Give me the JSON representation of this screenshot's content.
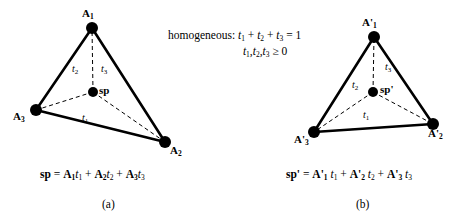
{
  "figure": {
    "type": "geometric-diagram",
    "constraint": {
      "prefix_label": "homogeneous:",
      "line1": "t1 + t2 + t3 = 1",
      "line2": "t1, t2, t3 >= 0",
      "sum_terms": [
        "t",
        "t",
        "t"
      ],
      "sum_subscripts": [
        "1",
        "2",
        "3"
      ],
      "sum_equals": "=",
      "sum_value": "1",
      "inequality_symbol": "≥",
      "inequality_value": "0"
    },
    "panels": [
      {
        "id": "a",
        "caption": "(a)",
        "prime": false,
        "point_label": "sp",
        "equation": {
          "lhs": "sp",
          "eq": "=",
          "terms": [
            {
              "vector": "A",
              "vsub": "1",
              "scalar": "t",
              "ssub": "1"
            },
            {
              "vector": "A",
              "vsub": "2",
              "scalar": "t",
              "ssub": "2"
            },
            {
              "vector": "A",
              "vsub": "3",
              "scalar": "t",
              "ssub": "3"
            }
          ],
          "plus": "+"
        },
        "vertices": [
          {
            "name": "A",
            "sub": "1",
            "x": 92,
            "y": 28,
            "label_x": 82,
            "label_y": 8
          },
          {
            "name": "A",
            "sub": "2",
            "x": 165,
            "y": 142,
            "label_x": 170,
            "label_y": 145
          },
          {
            "name": "A",
            "sub": "3",
            "x": 36,
            "y": 110,
            "label_x": 13,
            "label_y": 111
          }
        ],
        "point": {
          "x": 93,
          "y": 92,
          "label_x": 99,
          "label_y": 85
        },
        "parameters": [
          {
            "name": "t",
            "sub": "1",
            "x": 82,
            "y": 113
          },
          {
            "name": "t",
            "sub": "2",
            "x": 72,
            "y": 64
          },
          {
            "name": "t",
            "sub": "3",
            "x": 101,
            "y": 64
          }
        ]
      },
      {
        "id": "b",
        "caption": "(b)",
        "prime": true,
        "point_label": "sp'",
        "equation": {
          "lhs": "sp'",
          "eq": "=",
          "terms": [
            {
              "vector": "A'",
              "vsub": "1",
              "scalar": "t",
              "ssub": "1"
            },
            {
              "vector": "A'",
              "vsub": "2",
              "scalar": "t",
              "ssub": "2"
            },
            {
              "vector": "A'",
              "vsub": "3",
              "scalar": "t",
              "ssub": "3"
            }
          ],
          "plus": "+"
        },
        "vertices": [
          {
            "name": "A'",
            "sub": "1",
            "x": 374,
            "y": 37,
            "label_x": 362,
            "label_y": 17
          },
          {
            "name": "A'",
            "sub": "2",
            "x": 433,
            "y": 124,
            "label_x": 428,
            "label_y": 128
          },
          {
            "name": "A'",
            "sub": "3",
            "x": 314,
            "y": 132,
            "label_x": 294,
            "label_y": 134
          }
        ],
        "point": {
          "x": 373,
          "y": 92,
          "label_x": 380,
          "label_y": 84
        },
        "parameters": [
          {
            "name": "t",
            "sub": "1",
            "x": 363,
            "y": 110
          },
          {
            "name": "t",
            "sub": "2",
            "x": 352,
            "y": 80
          },
          {
            "name": "t",
            "sub": "3",
            "x": 385,
            "y": 62
          }
        ]
      }
    ],
    "style": {
      "line_color": "#000000",
      "fill_color": "#000000",
      "background": "#ffffff",
      "solid_stroke_width": "2.6",
      "dashed_stroke_width": "1",
      "vertex_radius": "6",
      "point_radius": "5"
    },
    "layout": {
      "constraint_x": 168,
      "constraint_y": 28,
      "equation_a_x": 40,
      "equation_a_y": 168,
      "equation_b_x": 286,
      "equation_b_y": 168,
      "caption_a_x": 102,
      "caption_a_y": 198,
      "caption_b_x": 356,
      "caption_b_y": 198
    }
  }
}
